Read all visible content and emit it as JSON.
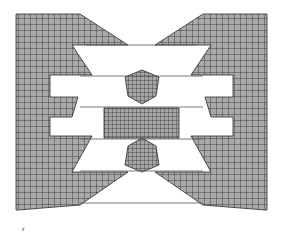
{
  "figure": {
    "type": "finite-element-mesh",
    "colors": {
      "background": "#ffffff",
      "mesh_fill": "#a9a9a9",
      "mesh_line": "#2b2b2b",
      "contact_line": "#555555"
    },
    "axis_marker": "z",
    "parts": [
      {
        "name": "left-die",
        "points": "16,14 80,14 128,45 72,45 92,75 50,75 50,97 78,97 72,117 50,117 50,136 92,136 72,172 128,172 80,205 18,210 16,210"
      },
      {
        "name": "right-die",
        "points": "267,14 203,14 155,45 211,45 191,75 233,75 233,97 205,97 211,117 233,117 233,136 191,136 211,172 155,172 203,205 265,210 267,210"
      },
      {
        "name": "upper-punch-tip",
        "points": "125,77 142,70 159,77 156,96 142,104 128,96"
      },
      {
        "name": "lower-punch-tip",
        "points": "128,146 142,138 156,146 159,165 142,172 125,165"
      },
      {
        "name": "center-workpiece",
        "points": "104,108 179,108 179,138 104,138"
      }
    ],
    "contact_lines": [
      {
        "x1": 86,
        "y1": 45,
        "x2": 197,
        "y2": 45
      },
      {
        "x1": 80,
        "y1": 76,
        "x2": 203,
        "y2": 76
      },
      {
        "x1": 80,
        "y1": 107,
        "x2": 203,
        "y2": 107
      },
      {
        "x1": 80,
        "y1": 139,
        "x2": 203,
        "y2": 139
      },
      {
        "x1": 80,
        "y1": 171,
        "x2": 203,
        "y2": 171
      },
      {
        "x1": 80,
        "y1": 203,
        "x2": 203,
        "y2": 203
      }
    ]
  }
}
